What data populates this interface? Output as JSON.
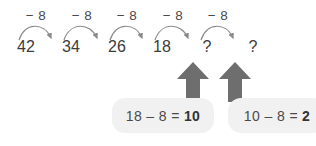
{
  "diagram": {
    "type": "number-line-subtraction-chain",
    "operation_label": "− 8",
    "steps": [
      {
        "label": "− 8"
      },
      {
        "label": "− 8"
      },
      {
        "label": "− 8"
      },
      {
        "label": "− 8"
      },
      {
        "label": "− 8"
      }
    ],
    "terms": [
      {
        "value": "42"
      },
      {
        "value": "34"
      },
      {
        "value": "26"
      },
      {
        "value": "18"
      },
      {
        "value": "?"
      },
      {
        "value": "?"
      }
    ],
    "callouts": [
      {
        "expression": "18 – 8 = ",
        "result": "10"
      },
      {
        "expression": "10 – 8 = ",
        "result": "2"
      }
    ],
    "colors": {
      "text": "#3c3c3c",
      "label_text": "#4a4a4a",
      "arc": "#8a8a8a",
      "big_arrow": "#6e6e6e",
      "callout_bg": "#f1f1f1",
      "result_text": "#333333",
      "background": "#ffffff"
    }
  }
}
